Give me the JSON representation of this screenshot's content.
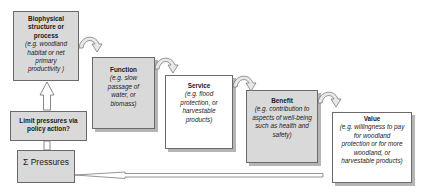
{
  "diagram": {
    "type": "ecosystem-services-cascade",
    "boxes": [
      {
        "id": "biophysical",
        "title": "Biophysical structure or process",
        "title_lines": [
          "Biophysical",
          "structure or",
          "process"
        ],
        "example": "(e.g. woodland habitat or net primary productivity )",
        "example_lines": [
          "(e.g. woodland",
          "habitat or net",
          "primary",
          "productivity )"
        ]
      },
      {
        "id": "function",
        "title": "Function",
        "example": "(e.g. slow passage of water, or biomass)",
        "example_lines": [
          "(e.g. slow",
          "passage of",
          "water, or",
          "biomass)"
        ]
      },
      {
        "id": "service",
        "title": "Service",
        "example": "(e.g. flood protection, or harvestable products)",
        "example_lines": [
          "(e.g. flood",
          "protection, or",
          "harvestable",
          "products)"
        ]
      },
      {
        "id": "benefit",
        "title": "Benefit",
        "example": "(e.g. contribution to aspects of well-being such as health and safety)",
        "example_lines": [
          "(e.g. contribution to",
          "aspects of well-being",
          "such as health and",
          "safety)"
        ]
      },
      {
        "id": "value",
        "title": "Value",
        "example": "(e.g. willingness to pay for woodland protection or for more woodland, or harvestable products)",
        "example_lines": [
          "(e.g. willingness to pay",
          "for woodland",
          "protection or for more",
          "woodland, or",
          "harvestable products)"
        ]
      }
    ],
    "limit_box": {
      "lines": [
        "Limit pressures via",
        "policy action?"
      ]
    },
    "pressures_box": {
      "label": "Σ Pressures"
    },
    "colors": {
      "shaded_fill": "#d9d9d9",
      "white_fill": "#ffffff",
      "border": "#6a6a6a",
      "shadow": "#b5b5b5"
    }
  }
}
